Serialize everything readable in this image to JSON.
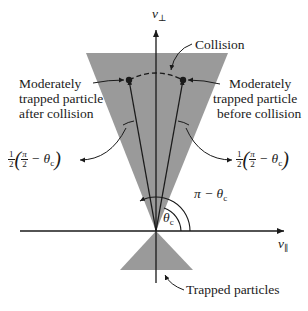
{
  "diagram": {
    "type": "velocity-space loss cone",
    "axes": {
      "vertical": {
        "label": "v",
        "subscript": "⊥"
      },
      "horizontal": {
        "label": "v",
        "subscript": "∥"
      }
    },
    "labels": {
      "collision": "Collision",
      "after_collision": [
        "Moderately",
        "trapped particle",
        "after collision"
      ],
      "before_collision": [
        "Moderately",
        "trapped particle",
        "before collision"
      ],
      "half_angle_left": {
        "prefix_num": "1",
        "prefix_den": "2",
        "pi_num": "π",
        "pi_den": "2",
        "rest": " − θ",
        "sub": "c"
      },
      "half_angle_right": {
        "prefix_num": "1",
        "prefix_den": "2",
        "pi_num": "π",
        "pi_den": "2",
        "rest": " − θ",
        "sub": "c"
      },
      "pi_minus_theta": {
        "text": "π − θ",
        "sub": "c"
      },
      "theta_c": {
        "text": "θ",
        "sub": "c"
      },
      "trapped": "Trapped particles"
    },
    "colors": {
      "cone_fill": "#9a9a9a",
      "line": "#1a1a1a",
      "background": "#ffffff"
    }
  }
}
